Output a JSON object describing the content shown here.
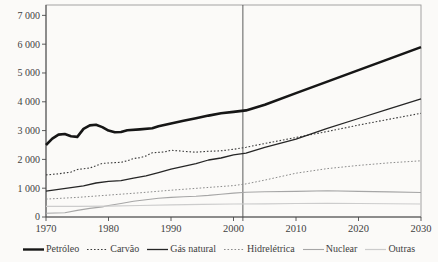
{
  "figure": {
    "background": "#fbfaf8",
    "text_color": "#3f3f3f",
    "box_color": "#9a9a9a",
    "axis_color": "#4a4a4a",
    "divider_color": "#4a4a4a"
  },
  "chart_data": {
    "type": "line",
    "title": "",
    "xlabel": "",
    "ylabel": "",
    "xlim": [
      1970,
      2030
    ],
    "ylim": [
      0,
      7360
    ],
    "grid": false,
    "legend_position": "bottom",
    "divider_year": 2001.5,
    "x_ticks": [
      {
        "value": 1970,
        "label": "1970"
      },
      {
        "value": 1980,
        "label": "1980"
      },
      {
        "value": 1990,
        "label": "1990"
      },
      {
        "value": 2000,
        "label": "2000"
      },
      {
        "value": 2010,
        "label": "2010"
      },
      {
        "value": 2020,
        "label": "2020"
      },
      {
        "value": 2030,
        "label": "2030"
      }
    ],
    "y_ticks": [
      {
        "value": 0,
        "label": "0"
      },
      {
        "value": 1000,
        "label": "1 000"
      },
      {
        "value": 2000,
        "label": "2 000"
      },
      {
        "value": 3000,
        "label": "3 000"
      },
      {
        "value": 4000,
        "label": "4 000"
      },
      {
        "value": 5000,
        "label": "5 000"
      },
      {
        "value": 6000,
        "label": "6 000"
      },
      {
        "value": 7000,
        "label": "7 000"
      }
    ],
    "series": [
      {
        "name": "Petróleo",
        "color": "#161616",
        "width": 2.6,
        "dash": "",
        "points": [
          [
            1970,
            2500
          ],
          [
            1971,
            2720
          ],
          [
            1972,
            2860
          ],
          [
            1973,
            2880
          ],
          [
            1974,
            2800
          ],
          [
            1975,
            2780
          ],
          [
            1976,
            3060
          ],
          [
            1977,
            3180
          ],
          [
            1978,
            3200
          ],
          [
            1979,
            3120
          ],
          [
            1980,
            3000
          ],
          [
            1981,
            2940
          ],
          [
            1982,
            2950
          ],
          [
            1983,
            3010
          ],
          [
            1985,
            3040
          ],
          [
            1987,
            3080
          ],
          [
            1988,
            3150
          ],
          [
            1990,
            3250
          ],
          [
            1992,
            3340
          ],
          [
            1994,
            3430
          ],
          [
            1996,
            3520
          ],
          [
            1998,
            3600
          ],
          [
            2000,
            3650
          ],
          [
            2002,
            3700
          ],
          [
            2005,
            3900
          ],
          [
            2010,
            4300
          ],
          [
            2015,
            4700
          ],
          [
            2020,
            5100
          ],
          [
            2025,
            5500
          ],
          [
            2030,
            5900
          ]
        ]
      },
      {
        "name": "Carvão",
        "color": "#3c3c3c",
        "width": 1.1,
        "dash": "1.6,1.9",
        "points": [
          [
            1970,
            1460
          ],
          [
            1972,
            1500
          ],
          [
            1974,
            1560
          ],
          [
            1975,
            1650
          ],
          [
            1977,
            1700
          ],
          [
            1978,
            1780
          ],
          [
            1979,
            1860
          ],
          [
            1981,
            1890
          ],
          [
            1982,
            1900
          ],
          [
            1983,
            1950
          ],
          [
            1984,
            2030
          ],
          [
            1985,
            2060
          ],
          [
            1986,
            2120
          ],
          [
            1987,
            2230
          ],
          [
            1989,
            2260
          ],
          [
            1990,
            2320
          ],
          [
            1992,
            2280
          ],
          [
            1994,
            2250
          ],
          [
            1996,
            2280
          ],
          [
            1998,
            2300
          ],
          [
            2000,
            2350
          ],
          [
            2002,
            2420
          ],
          [
            2005,
            2550
          ],
          [
            2010,
            2760
          ],
          [
            2015,
            2970
          ],
          [
            2020,
            3190
          ],
          [
            2025,
            3400
          ],
          [
            2030,
            3600
          ]
        ]
      },
      {
        "name": "Gás natural",
        "color": "#262626",
        "width": 1.3,
        "dash": "",
        "points": [
          [
            1970,
            900
          ],
          [
            1972,
            960
          ],
          [
            1974,
            1020
          ],
          [
            1976,
            1080
          ],
          [
            1978,
            1180
          ],
          [
            1980,
            1240
          ],
          [
            1982,
            1260
          ],
          [
            1984,
            1350
          ],
          [
            1986,
            1430
          ],
          [
            1988,
            1540
          ],
          [
            1990,
            1660
          ],
          [
            1992,
            1760
          ],
          [
            1994,
            1850
          ],
          [
            1996,
            1980
          ],
          [
            1998,
            2050
          ],
          [
            2000,
            2160
          ],
          [
            2002,
            2220
          ],
          [
            2005,
            2420
          ],
          [
            2010,
            2700
          ],
          [
            2015,
            3080
          ],
          [
            2020,
            3420
          ],
          [
            2025,
            3760
          ],
          [
            2030,
            4100
          ]
        ]
      },
      {
        "name": "Hidrelétrica",
        "color": "#8c8c8c",
        "width": 1.0,
        "dash": "1.6,1.9",
        "points": [
          [
            1970,
            620
          ],
          [
            1975,
            680
          ],
          [
            1980,
            760
          ],
          [
            1985,
            840
          ],
          [
            1990,
            930
          ],
          [
            1995,
            1010
          ],
          [
            2000,
            1090
          ],
          [
            2002,
            1150
          ],
          [
            2005,
            1280
          ],
          [
            2010,
            1520
          ],
          [
            2015,
            1680
          ],
          [
            2020,
            1790
          ],
          [
            2025,
            1880
          ],
          [
            2030,
            1950
          ]
        ]
      },
      {
        "name": "Nuclear",
        "color": "#a6a6a6",
        "width": 1.1,
        "dash": "",
        "points": [
          [
            1970,
            130
          ],
          [
            1973,
            150
          ],
          [
            1975,
            230
          ],
          [
            1977,
            300
          ],
          [
            1979,
            350
          ],
          [
            1980,
            400
          ],
          [
            1982,
            470
          ],
          [
            1984,
            545
          ],
          [
            1986,
            600
          ],
          [
            1988,
            650
          ],
          [
            1990,
            680
          ],
          [
            1992,
            700
          ],
          [
            1994,
            720
          ],
          [
            1996,
            750
          ],
          [
            1998,
            790
          ],
          [
            2000,
            830
          ],
          [
            2002,
            860
          ],
          [
            2005,
            880
          ],
          [
            2010,
            890
          ],
          [
            2015,
            910
          ],
          [
            2020,
            890
          ],
          [
            2025,
            870
          ],
          [
            2030,
            850
          ]
        ]
      },
      {
        "name": "Outras",
        "color": "#cccccc",
        "width": 1.2,
        "dash": "",
        "points": [
          [
            1970,
            370
          ],
          [
            1975,
            370
          ],
          [
            1980,
            380
          ],
          [
            1985,
            400
          ],
          [
            1990,
            420
          ],
          [
            1995,
            440
          ],
          [
            2000,
            450
          ],
          [
            2005,
            460
          ],
          [
            2010,
            470
          ],
          [
            2015,
            475
          ],
          [
            2020,
            470
          ],
          [
            2030,
            450
          ]
        ]
      }
    ]
  }
}
